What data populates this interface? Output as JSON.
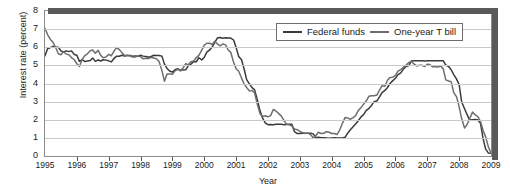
{
  "chart_data": {
    "type": "line",
    "title": "",
    "xlabel": "Year",
    "ylabel": "Interest rate (percent)",
    "xlim": [
      1995,
      2009
    ],
    "ylim": [
      0,
      8
    ],
    "ytick_labels": [
      "0",
      "1",
      "2",
      "3",
      "4",
      "5",
      "6",
      "7",
      "8"
    ],
    "ytick_values": [
      0,
      1,
      2,
      3,
      4,
      5,
      6,
      7,
      8
    ],
    "xtick_labels": [
      "1995",
      "1996",
      "1997",
      "1998",
      "1999",
      "2000",
      "2001",
      "2002",
      "2003",
      "2004",
      "2005",
      "2006",
      "2007",
      "2008",
      "2009"
    ],
    "xtick_values": [
      1995,
      1996,
      1997,
      1998,
      1999,
      2000,
      2001,
      2002,
      2003,
      2004,
      2005,
      2006,
      2007,
      2008,
      2009
    ],
    "grid": "horizontal",
    "legend_position": "top-right",
    "legend": [
      "Federal funds",
      "One-year T bill"
    ],
    "colors": {
      "federal_funds": "#3a3a3a",
      "one_year_t_bill": "#6e6e6e",
      "gridline": "#c9c9c9",
      "frame": "#8c8c8c",
      "band": "#5a5a5a"
    },
    "series": [
      {
        "name": "Federal funds",
        "color": "#3a3a3a",
        "x": [
          1995.0,
          1995.08,
          1995.17,
          1995.25,
          1995.33,
          1995.42,
          1995.5,
          1995.58,
          1995.67,
          1995.75,
          1995.83,
          1995.92,
          1996.0,
          1996.08,
          1996.17,
          1996.25,
          1996.33,
          1996.42,
          1996.5,
          1996.58,
          1996.67,
          1996.75,
          1996.83,
          1996.92,
          1997.0,
          1997.08,
          1997.17,
          1997.25,
          1997.33,
          1997.42,
          1997.5,
          1997.58,
          1997.67,
          1997.75,
          1997.83,
          1997.92,
          1998.0,
          1998.08,
          1998.17,
          1998.25,
          1998.33,
          1998.42,
          1998.5,
          1998.58,
          1998.67,
          1998.75,
          1998.83,
          1998.92,
          1999.0,
          1999.08,
          1999.17,
          1999.25,
          1999.33,
          1999.42,
          1999.5,
          1999.58,
          1999.67,
          1999.75,
          1999.83,
          1999.92,
          2000.0,
          2000.08,
          2000.17,
          2000.25,
          2000.33,
          2000.42,
          2000.5,
          2000.58,
          2000.67,
          2000.75,
          2000.83,
          2000.92,
          2001.0,
          2001.08,
          2001.17,
          2001.25,
          2001.33,
          2001.42,
          2001.5,
          2001.58,
          2001.67,
          2001.75,
          2001.83,
          2001.92,
          2002.0,
          2002.08,
          2002.17,
          2002.25,
          2002.33,
          2002.42,
          2002.5,
          2002.58,
          2002.67,
          2002.75,
          2002.83,
          2002.92,
          2003.0,
          2003.08,
          2003.17,
          2003.25,
          2003.33,
          2003.42,
          2003.5,
          2003.58,
          2003.67,
          2003.75,
          2003.83,
          2003.92,
          2004.0,
          2004.08,
          2004.17,
          2004.25,
          2004.33,
          2004.42,
          2004.5,
          2004.58,
          2004.67,
          2004.75,
          2004.83,
          2004.92,
          2005.0,
          2005.08,
          2005.17,
          2005.25,
          2005.33,
          2005.42,
          2005.5,
          2005.58,
          2005.67,
          2005.75,
          2005.83,
          2005.92,
          2006.0,
          2006.08,
          2006.17,
          2006.25,
          2006.33,
          2006.42,
          2006.5,
          2006.58,
          2006.67,
          2006.75,
          2006.83,
          2006.92,
          2007.0,
          2007.08,
          2007.17,
          2007.25,
          2007.33,
          2007.42,
          2007.5,
          2007.58,
          2007.67,
          2007.75,
          2007.83,
          2007.92,
          2008.0,
          2008.08,
          2008.17,
          2008.25,
          2008.33,
          2008.42,
          2008.5,
          2008.58,
          2008.67,
          2008.75,
          2008.83,
          2008.92,
          2009.0
        ],
        "values": [
          5.53,
          5.92,
          5.98,
          6.05,
          6.0,
          6.0,
          5.8,
          5.74,
          5.8,
          5.76,
          5.8,
          5.6,
          5.56,
          5.22,
          5.31,
          5.22,
          5.24,
          5.27,
          5.4,
          5.22,
          5.3,
          5.24,
          5.31,
          5.29,
          5.25,
          5.19,
          5.39,
          5.51,
          5.5,
          5.56,
          5.52,
          5.54,
          5.54,
          5.5,
          5.52,
          5.5,
          5.56,
          5.51,
          5.49,
          5.45,
          5.49,
          5.56,
          5.54,
          5.55,
          5.51,
          5.07,
          4.83,
          4.68,
          4.63,
          4.76,
          4.81,
          4.74,
          4.74,
          4.76,
          4.99,
          5.07,
          5.22,
          5.2,
          5.42,
          5.3,
          5.45,
          5.73,
          5.85,
          6.02,
          6.27,
          6.53,
          6.54,
          6.5,
          6.52,
          6.51,
          6.51,
          6.4,
          5.98,
          5.49,
          5.31,
          4.8,
          4.21,
          3.97,
          3.77,
          3.65,
          3.07,
          2.49,
          2.09,
          1.82,
          1.73,
          1.74,
          1.73,
          1.75,
          1.75,
          1.75,
          1.73,
          1.74,
          1.75,
          1.75,
          1.34,
          1.24,
          1.24,
          1.26,
          1.25,
          1.26,
          1.26,
          1.22,
          1.01,
          1.03,
          1.01,
          1.01,
          1.0,
          0.98,
          1.0,
          1.01,
          1.0,
          1.0,
          1.0,
          1.03,
          1.26,
          1.43,
          1.61,
          1.76,
          1.93,
          2.16,
          2.28,
          2.5,
          2.63,
          2.79,
          3.0,
          3.04,
          3.26,
          3.5,
          3.62,
          3.78,
          4.0,
          4.16,
          4.29,
          4.49,
          4.59,
          4.79,
          4.94,
          4.99,
          5.24,
          5.25,
          5.25,
          5.25,
          5.25,
          5.24,
          5.25,
          5.26,
          5.26,
          5.25,
          5.25,
          5.25,
          5.26,
          5.02,
          4.94,
          4.76,
          4.49,
          4.24,
          3.94,
          2.98,
          2.61,
          2.28,
          1.98,
          2.0,
          2.01,
          2.0,
          1.81,
          0.97,
          0.39,
          0.16,
          0.15
        ]
      },
      {
        "name": "One-year T bill",
        "color": "#6e6e6e",
        "x": [
          1995.0,
          1995.08,
          1995.17,
          1995.25,
          1995.33,
          1995.42,
          1995.5,
          1995.58,
          1995.67,
          1995.75,
          1995.83,
          1995.92,
          1996.0,
          1996.08,
          1996.17,
          1996.25,
          1996.33,
          1996.42,
          1996.5,
          1996.58,
          1996.67,
          1996.75,
          1996.83,
          1996.92,
          1997.0,
          1997.08,
          1997.17,
          1997.25,
          1997.33,
          1997.42,
          1997.5,
          1997.58,
          1997.67,
          1997.75,
          1997.83,
          1997.92,
          1998.0,
          1998.08,
          1998.17,
          1998.25,
          1998.33,
          1998.42,
          1998.5,
          1998.58,
          1998.67,
          1998.75,
          1998.83,
          1998.92,
          1999.0,
          1999.08,
          1999.17,
          1999.25,
          1999.33,
          1999.42,
          1999.5,
          1999.58,
          1999.67,
          1999.75,
          1999.83,
          1999.92,
          2000.0,
          2000.08,
          2000.17,
          2000.25,
          2000.33,
          2000.42,
          2000.5,
          2000.58,
          2000.67,
          2000.75,
          2000.83,
          2000.92,
          2001.0,
          2001.08,
          2001.17,
          2001.25,
          2001.33,
          2001.42,
          2001.5,
          2001.58,
          2001.67,
          2001.75,
          2001.83,
          2001.92,
          2002.0,
          2002.08,
          2002.17,
          2002.25,
          2002.33,
          2002.42,
          2002.5,
          2002.58,
          2002.67,
          2002.75,
          2002.83,
          2002.92,
          2003.0,
          2003.08,
          2003.17,
          2003.25,
          2003.33,
          2003.42,
          2003.5,
          2003.58,
          2003.67,
          2003.75,
          2003.83,
          2003.92,
          2004.0,
          2004.08,
          2004.17,
          2004.25,
          2004.33,
          2004.42,
          2004.5,
          2004.58,
          2004.67,
          2004.75,
          2004.83,
          2004.92,
          2005.0,
          2005.08,
          2005.17,
          2005.25,
          2005.33,
          2005.42,
          2005.5,
          2005.58,
          2005.67,
          2005.75,
          2005.83,
          2005.92,
          2006.0,
          2006.08,
          2006.17,
          2006.25,
          2006.33,
          2006.42,
          2006.5,
          2006.58,
          2006.67,
          2006.75,
          2006.83,
          2006.92,
          2007.0,
          2007.08,
          2007.17,
          2007.25,
          2007.33,
          2007.42,
          2007.5,
          2007.58,
          2007.67,
          2007.75,
          2007.83,
          2007.92,
          2008.0,
          2008.08,
          2008.17,
          2008.25,
          2008.33,
          2008.42,
          2008.5,
          2008.58,
          2008.67,
          2008.75,
          2008.83,
          2008.92,
          2009.0
        ],
        "values": [
          7.05,
          6.7,
          6.43,
          6.27,
          6.0,
          5.64,
          5.59,
          5.75,
          5.62,
          5.59,
          5.43,
          5.31,
          5.09,
          4.94,
          5.34,
          5.54,
          5.64,
          5.81,
          5.85,
          5.67,
          5.83,
          5.55,
          5.42,
          5.47,
          5.61,
          5.53,
          5.8,
          5.99,
          5.87,
          5.69,
          5.54,
          5.56,
          5.52,
          5.46,
          5.46,
          5.53,
          5.48,
          5.36,
          5.39,
          5.38,
          5.44,
          5.41,
          5.36,
          5.21,
          4.71,
          4.12,
          4.53,
          4.52,
          4.51,
          4.7,
          4.78,
          4.69,
          4.85,
          5.1,
          5.03,
          5.2,
          5.25,
          5.43,
          5.55,
          5.84,
          6.12,
          6.22,
          6.22,
          6.15,
          6.33,
          6.17,
          6.08,
          6.18,
          6.13,
          5.85,
          5.72,
          5.17,
          4.81,
          4.68,
          4.3,
          3.98,
          3.78,
          3.58,
          3.62,
          3.47,
          2.82,
          2.33,
          2.18,
          2.22,
          2.16,
          2.23,
          2.57,
          2.48,
          2.35,
          2.2,
          1.96,
          1.76,
          1.72,
          1.65,
          1.49,
          1.45,
          1.36,
          1.3,
          1.24,
          1.27,
          1.18,
          1.01,
          1.12,
          1.31,
          1.24,
          1.25,
          1.34,
          1.31,
          1.24,
          1.24,
          1.19,
          1.43,
          1.78,
          2.12,
          2.1,
          2.02,
          2.12,
          2.23,
          2.5,
          2.67,
          2.86,
          3.03,
          3.3,
          3.32,
          3.33,
          3.36,
          3.64,
          3.87,
          3.85,
          4.18,
          4.33,
          4.35,
          4.45,
          4.68,
          4.77,
          4.9,
          5.0,
          5.16,
          5.22,
          5.08,
          4.97,
          5.01,
          5.01,
          4.94,
          5.06,
          5.05,
          4.92,
          4.93,
          4.91,
          4.96,
          4.82,
          4.2,
          4.14,
          4.1,
          3.5,
          3.26,
          2.71,
          2.05,
          1.54,
          1.74,
          2.06,
          2.42,
          2.28,
          2.18,
          1.91,
          1.42,
          1.07,
          0.49,
          0.18
        ]
      }
    ],
    "annotations": []
  }
}
